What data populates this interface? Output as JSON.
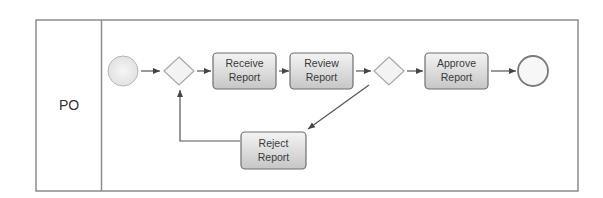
{
  "diagram": {
    "type": "bpmn-process",
    "pool": {
      "lane": {
        "label": "PO"
      }
    },
    "nodes": {
      "start_event": {
        "kind": "start-event"
      },
      "gateway_1": {
        "kind": "exclusive-gateway"
      },
      "receive_report": {
        "kind": "task",
        "line1": "Receive",
        "line2": "Report"
      },
      "review_report": {
        "kind": "task",
        "line1": "Review",
        "line2": "Report"
      },
      "gateway_2": {
        "kind": "exclusive-gateway"
      },
      "approve_report": {
        "kind": "task",
        "line1": "Approve",
        "line2": "Report"
      },
      "end_event": {
        "kind": "end-event"
      },
      "reject_report": {
        "kind": "task",
        "line1": "Reject",
        "line2": "Report"
      }
    },
    "flows": [
      {
        "from": "start_event",
        "to": "gateway_1"
      },
      {
        "from": "gateway_1",
        "to": "receive_report"
      },
      {
        "from": "receive_report",
        "to": "review_report"
      },
      {
        "from": "review_report",
        "to": "gateway_2"
      },
      {
        "from": "gateway_2",
        "to": "approve_report"
      },
      {
        "from": "approve_report",
        "to": "end_event"
      },
      {
        "from": "gateway_2",
        "to": "reject_report"
      },
      {
        "from": "reject_report",
        "to": "gateway_1"
      }
    ],
    "colors": {
      "border": "#8a8a8a",
      "task_fill_top": "#f2f2f2",
      "task_fill_bottom": "#c9c9c9",
      "task_stroke": "#6e6e6e",
      "event_fill": "#ececec",
      "gateway_fill": "#f3f3f3",
      "arrow": "#555555"
    }
  }
}
